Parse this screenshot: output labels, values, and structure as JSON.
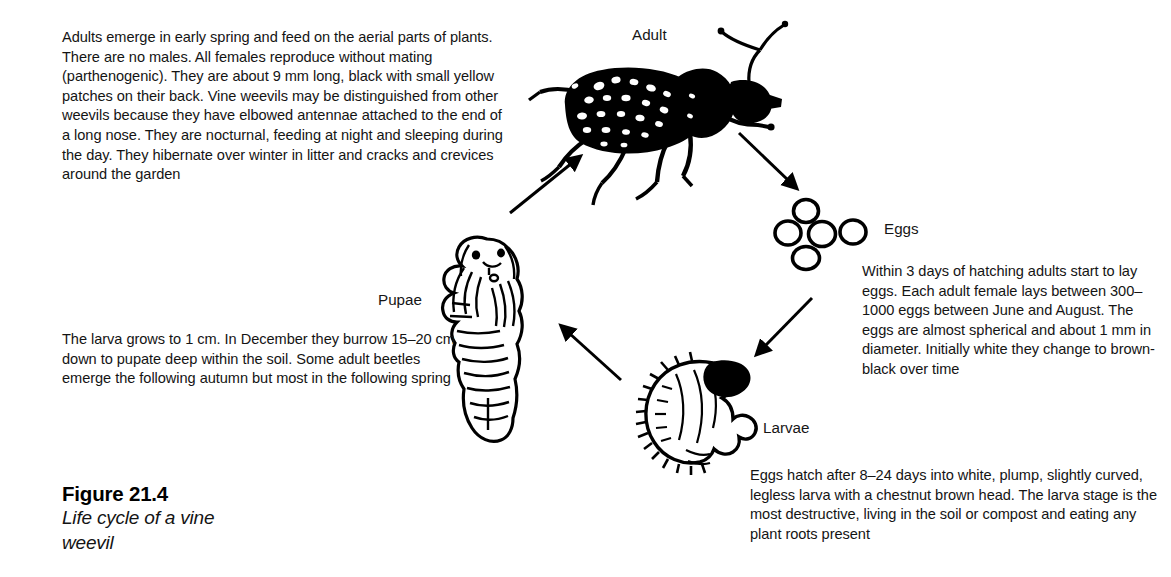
{
  "figure": {
    "caption_title": "Figure 21.4",
    "caption_subtitle": "Life cycle of a vine\nweevil"
  },
  "stages": {
    "adult": {
      "label": "Adult",
      "description": "Adults emerge in early spring and feed on the aerial parts of plants. There are no males. All females reproduce without mating (parthenogenic). They are about 9 mm long, black with small yellow patches on their back. Vine weevils may be distinguished from other weevils because they have elbowed antennae attached to the end of a long nose. They are nocturnal, feeding at night and sleeping during the day. They hibernate over winter in litter and cracks and crevices around the garden"
    },
    "eggs": {
      "label": "Eggs",
      "description": "Within 3 days of hatching adults start to lay eggs. Each adult female lays between 300–1000 eggs between June and August. The eggs are almost spherical and about 1 mm in diameter. Initially white they change to brown-black over time",
      "count": 5
    },
    "larvae": {
      "label": "Larvae",
      "description": "Eggs hatch after 8–24 days into white, plump, slightly curved, legless larva with a chestnut brown head. The larva stage is the most destructive, living in the soil or compost and eating any plant roots present"
    },
    "pupae": {
      "label": "Pupae",
      "description": "The larva grows to 1 cm. In December they burrow 15–20 cm down to pupate deep within the soil. Some adult beetles emerge the following autumn but most in the following spring"
    }
  },
  "arrows": [
    {
      "name": "arrow-pupae-to-adult",
      "from": "pupae",
      "to": "adult"
    },
    {
      "name": "arrow-adult-to-eggs",
      "from": "adult",
      "to": "eggs"
    },
    {
      "name": "arrow-eggs-to-larvae",
      "from": "eggs",
      "to": "larvae"
    },
    {
      "name": "arrow-larvae-to-pupae",
      "from": "larvae",
      "to": "pupae"
    }
  ],
  "colors": {
    "background": "#ffffff",
    "ink": "#000000",
    "text": "#141414"
  }
}
